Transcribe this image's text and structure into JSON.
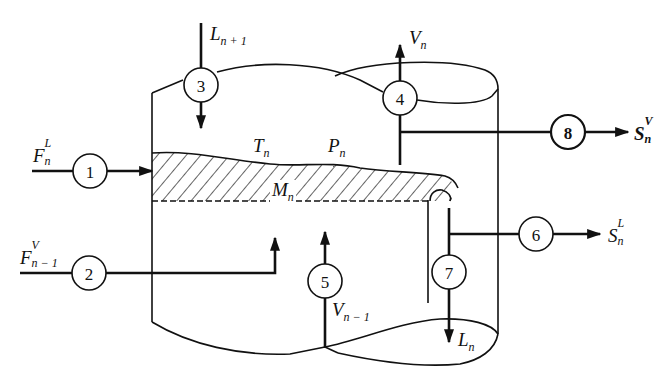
{
  "diagram": {
    "stage_variables": {
      "temperature": {
        "base": "T",
        "sub": "n"
      },
      "pressure": {
        "base": "P",
        "sub": "n"
      },
      "holdup": {
        "base": "M",
        "sub": "n"
      }
    },
    "streams": [
      {
        "id": "1",
        "name": "liquid feed",
        "label": {
          "base": "F",
          "sup": "L",
          "sub": "n"
        },
        "direction": "in"
      },
      {
        "id": "2",
        "name": "vapor feed",
        "label": {
          "base": "F",
          "sup": "V",
          "sub": "n − 1"
        },
        "direction": "in"
      },
      {
        "id": "3",
        "name": "liquid from stage above",
        "label": {
          "base": "L",
          "sub": "n + 1"
        },
        "direction": "in"
      },
      {
        "id": "4",
        "name": "vapor to stage above",
        "label": {
          "base": "V",
          "sub": "n"
        },
        "direction": "out"
      },
      {
        "id": "5",
        "name": "vapor from stage below",
        "label": {
          "base": "V",
          "sub": "n − 1"
        },
        "direction": "in"
      },
      {
        "id": "6",
        "name": "liquid side draw",
        "label": {
          "base": "S",
          "sup": "L",
          "sub": "n"
        },
        "direction": "out"
      },
      {
        "id": "7",
        "name": "liquid to stage below",
        "label": {
          "base": "L",
          "sub": "n"
        },
        "direction": "out"
      },
      {
        "id": "8",
        "name": "vapor side draw",
        "label": {
          "base": "S",
          "sup": "V",
          "sub": "n"
        },
        "direction": "out"
      }
    ],
    "node_labels": [
      "1",
      "2",
      "3",
      "4",
      "5",
      "6",
      "7",
      "8"
    ],
    "colors": {
      "ink": "#111111",
      "background": "#ffffff"
    }
  }
}
